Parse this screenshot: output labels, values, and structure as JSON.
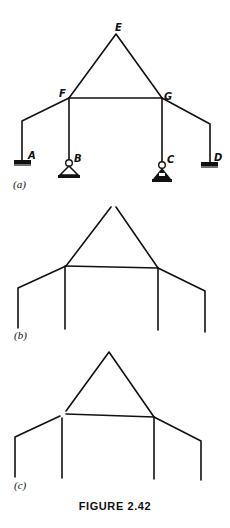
{
  "figure": {
    "caption": "FIGURE 2.42",
    "panels": [
      {
        "id": "a",
        "label": "(a)",
        "joint_labels": {
          "E": "E",
          "F": "F",
          "G": "G",
          "A": "A",
          "B": "B",
          "C": "C",
          "D": "D"
        },
        "supports": [
          {
            "joint": "A",
            "type": "fixed"
          },
          {
            "joint": "B",
            "type": "pin"
          },
          {
            "joint": "C",
            "type": "pin"
          },
          {
            "joint": "D",
            "type": "fixed"
          }
        ]
      },
      {
        "id": "b",
        "label": "(b)",
        "note": "released at apex E"
      },
      {
        "id": "c",
        "label": "(c)",
        "note": "released at joint F"
      }
    ]
  },
  "colors": {
    "ink": "#111111",
    "background": "#ffffff"
  }
}
